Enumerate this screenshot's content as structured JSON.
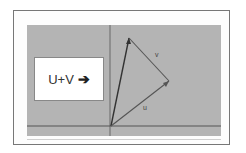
{
  "diagram": {
    "title_box": {
      "label": "U+V",
      "arrow_icon": "➔"
    },
    "vectors": [
      {
        "name": "u",
        "label": "u",
        "from": [
          111,
          126
        ],
        "to": [
          169,
          81
        ]
      },
      {
        "name": "v",
        "label": "v",
        "from": [
          169,
          81
        ],
        "to": [
          129,
          38
        ]
      },
      {
        "name": "u+v",
        "label": "",
        "from": [
          111,
          126
        ],
        "to": [
          129,
          38
        ]
      }
    ],
    "axes": {
      "x_axis_y": 126,
      "y_axis_x": 110
    },
    "colors": {
      "panel": "#b4b4b4",
      "vector": "#444444",
      "axis": "#555555"
    }
  }
}
